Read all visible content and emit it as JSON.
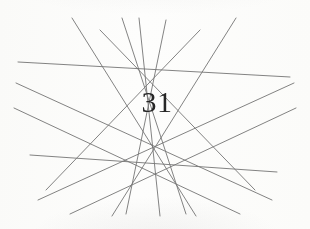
{
  "figure": {
    "label": "31",
    "canvas": {
      "width": 310,
      "height": 229
    },
    "background_color": "#fdfdfc",
    "line_color": "#6a6a6a",
    "line_width": 0.9,
    "label_color": "#262626",
    "label_font_size": 30
  },
  "chart_data": {
    "type": "line",
    "title": "31",
    "xlabel": "",
    "ylabel": "",
    "xlim": [
      0,
      310
    ],
    "ylim": [
      0,
      229
    ],
    "grid": false,
    "legend": "none",
    "annotations": [
      {
        "text": "31",
        "x": 150,
        "y": 112
      }
    ],
    "series": [
      {
        "name": "line-1",
        "x": [
          18,
          290
        ],
        "y": [
          62,
          77
        ]
      },
      {
        "name": "line-2",
        "x": [
          30,
          277
        ],
        "y": [
          155,
          172
        ]
      },
      {
        "name": "line-3",
        "x": [
          72,
          196
        ],
        "y": [
          18,
          216
        ]
      },
      {
        "name": "line-4",
        "x": [
          139,
          160
        ],
        "y": [
          18,
          216
        ]
      },
      {
        "name": "line-5",
        "x": [
          236,
          112
        ],
        "y": [
          18,
          216
        ]
      },
      {
        "name": "line-6",
        "x": [
          100,
          255
        ],
        "y": [
          30,
          190
        ]
      },
      {
        "name": "line-7",
        "x": [
          200,
          46
        ],
        "y": [
          30,
          190
        ]
      },
      {
        "name": "line-8",
        "x": [
          16,
          272
        ],
        "y": [
          83,
          200
        ]
      },
      {
        "name": "line-9",
        "x": [
          294,
          38
        ],
        "y": [
          83,
          200
        ]
      },
      {
        "name": "line-10",
        "x": [
          14,
          240
        ],
        "y": [
          108,
          214
        ]
      },
      {
        "name": "line-11",
        "x": [
          296,
          70
        ],
        "y": [
          108,
          214
        ]
      },
      {
        "name": "line-12",
        "x": [
          122,
          186
        ],
        "y": [
          18,
          214
        ]
      },
      {
        "name": "line-13",
        "x": [
          166,
          126
        ],
        "y": [
          20,
          214
        ]
      }
    ]
  }
}
